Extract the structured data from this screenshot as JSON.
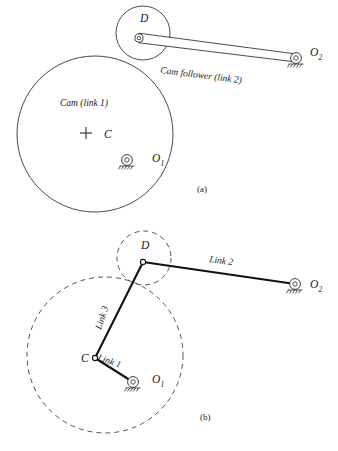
{
  "figure": {
    "background_color": "#ffffff",
    "line_color": "#2b2b2b",
    "link_color": "#111111",
    "width": 338,
    "height": 451
  },
  "diagram_a": {
    "caption": "(a)",
    "caption_x": 197,
    "caption_y": 192,
    "cam_label": "Cam (link 1)",
    "cam_label_x": 60,
    "cam_label_y": 106,
    "follower_label": "Cam follower (link 2)",
    "follower_label_x": 160,
    "follower_label_y": 73,
    "follower_label_rotation": 7.2,
    "point_D": "D",
    "point_D_x": 140,
    "point_D_y": 22,
    "point_C": "C",
    "point_C_x": 104,
    "point_C_y": 138,
    "point_O1": "O",
    "point_O1_sub": "1",
    "point_O1_x": 152,
    "point_O1_y": 162,
    "point_O2": "O",
    "point_O2_sub": "2",
    "point_O2_x": 310,
    "point_O2_y": 56,
    "cam_circle": {
      "cx": 95,
      "cy": 134,
      "r": 78
    },
    "roller_circle": {
      "cx": 143,
      "cy": 33,
      "r": 27
    },
    "pivot_D": {
      "cx": 139,
      "cy": 38
    },
    "pivot_O1": {
      "cx": 127,
      "cy": 160
    },
    "pivot_O2": {
      "cx": 296,
      "cy": 58
    },
    "cross_C": {
      "cx": 86,
      "cy": 133,
      "size": 6
    }
  },
  "diagram_b": {
    "caption": "(b)",
    "caption_x": 200,
    "caption_y": 420,
    "link1_label": "Link 1",
    "link1_label_x": 97,
    "link1_label_y": 360,
    "link1_label_rotation": 19,
    "link2_label": "Link 2",
    "link2_label_x": 209,
    "link2_label_y": 262,
    "link2_label_rotation": 7.5,
    "link3_label": "Link 3",
    "link3_label_x": 101,
    "link3_label_y": 330,
    "link3_label_rotation": -72,
    "point_D": "D",
    "point_D_x": 141,
    "point_D_y": 249,
    "point_C": "C",
    "point_C_x": 81,
    "point_C_y": 362,
    "point_O1": "O",
    "point_O1_sub": "1",
    "point_O1_x": 152,
    "point_O1_y": 383,
    "point_O2": "O",
    "point_O2_sub": "2",
    "point_O2_x": 310,
    "point_O2_y": 288,
    "cam_circle_dashed": {
      "cx": 105,
      "cy": 355,
      "r": 78
    },
    "roller_circle_dashed": {
      "cx": 144,
      "cy": 258,
      "r": 27
    },
    "node_D": {
      "cx": 143,
      "cy": 262
    },
    "node_C": {
      "cx": 95,
      "cy": 358
    },
    "pivot_O1": {
      "cx": 133,
      "cy": 382
    },
    "pivot_O2": {
      "cx": 295,
      "cy": 284
    }
  }
}
